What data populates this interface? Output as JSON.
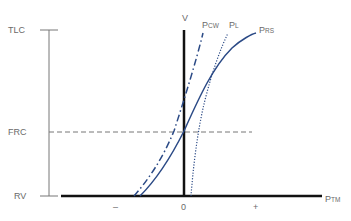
{
  "diagram": {
    "y_labels": {
      "tlc": "TLC",
      "frc": "FRC",
      "rv": "RV"
    },
    "x_labels": {
      "minus": "–",
      "zero": "0",
      "plus": "+"
    },
    "axis": {
      "volume": "V",
      "pressure_main": "P",
      "pressure_sub": "TM"
    },
    "curves": {
      "chest_wall": {
        "main": "P",
        "sub": "CW",
        "style": "dash-dot"
      },
      "lung": {
        "main": "P",
        "sub": "L",
        "style": "dotted"
      },
      "respiratory_system": {
        "main": "P",
        "sub": "RS",
        "style": "solid"
      }
    },
    "colors": {
      "curve": "#2b4a86",
      "axis": "#111111",
      "thin_axis": "#777777",
      "label": "#6a6a6a"
    }
  }
}
